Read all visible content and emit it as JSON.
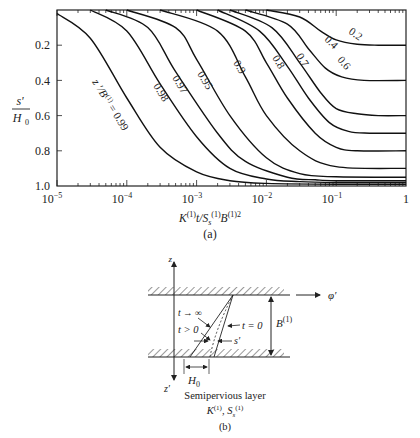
{
  "chart_data": [
    {
      "panel": "(a)",
      "type": "line",
      "title": "",
      "xlabel": "K(1) t / Ss(1) B(1)2",
      "ylabel": "s' / H0",
      "xscale": "log",
      "xlim": [
        1e-05,
        1
      ],
      "ylim": [
        1.0,
        0
      ],
      "y_inverted": true,
      "grid": false,
      "legend": "inline curve labels",
      "x_ticks": [
        "10^-5",
        "10^-4",
        "10^-3",
        "10^-2",
        "10^-1",
        "1"
      ],
      "y_ticks": [
        "0.2",
        "0.4",
        "0.6",
        "0.8",
        "1.0"
      ],
      "curve_parameter": "z'/B(1)",
      "series": [
        {
          "name": "0.99",
          "label": "z'/B(1) = 0.99",
          "x": [
            1e-05,
            3e-05,
            0.0001,
            0.0003,
            0.001,
            0.003,
            0.01,
            0.1,
            1
          ],
          "values": [
            0.02,
            0.16,
            0.5,
            0.78,
            0.92,
            0.97,
            0.985,
            0.99,
            0.99
          ]
        },
        {
          "name": "0.98",
          "label": "0.98",
          "x": [
            3e-05,
            0.0001,
            0.0003,
            0.001,
            0.003,
            0.01,
            0.03,
            0.1,
            1
          ],
          "values": [
            0.0,
            0.12,
            0.42,
            0.72,
            0.9,
            0.96,
            0.975,
            0.98,
            0.98
          ]
        },
        {
          "name": "0.97",
          "label": "0.97",
          "x": [
            5e-05,
            0.0002,
            0.0005,
            0.002,
            0.005,
            0.02,
            0.05,
            0.1,
            1
          ],
          "values": [
            0.0,
            0.1,
            0.35,
            0.7,
            0.86,
            0.95,
            0.965,
            0.97,
            0.97
          ]
        },
        {
          "name": "0.95",
          "label": "0.95",
          "x": [
            0.0001,
            0.0005,
            0.001,
            0.003,
            0.01,
            0.03,
            0.1,
            1
          ],
          "values": [
            0.0,
            0.1,
            0.28,
            0.6,
            0.84,
            0.93,
            0.948,
            0.95
          ]
        },
        {
          "name": "0.9",
          "label": "0.9",
          "x": [
            0.0003,
            0.002,
            0.005,
            0.01,
            0.03,
            0.1,
            1
          ],
          "values": [
            0.0,
            0.12,
            0.38,
            0.6,
            0.8,
            0.89,
            0.9
          ]
        },
        {
          "name": "0.8",
          "label": "0.8",
          "x": [
            0.001,
            0.005,
            0.01,
            0.02,
            0.05,
            0.1,
            0.2,
            1
          ],
          "values": [
            0.0,
            0.12,
            0.3,
            0.5,
            0.7,
            0.78,
            0.8,
            0.8
          ]
        },
        {
          "name": "0.7",
          "label": "0.7",
          "x": [
            0.002,
            0.008,
            0.02,
            0.04,
            0.08,
            0.15,
            0.3,
            1
          ],
          "values": [
            0.0,
            0.12,
            0.32,
            0.5,
            0.64,
            0.69,
            0.7,
            0.7
          ]
        },
        {
          "name": "0.6",
          "label": "0.6",
          "x": [
            0.003,
            0.012,
            0.03,
            0.06,
            0.1,
            0.2,
            0.4,
            1
          ],
          "values": [
            0.0,
            0.1,
            0.3,
            0.47,
            0.56,
            0.59,
            0.6,
            0.6
          ]
        },
        {
          "name": "0.4",
          "label": "0.4",
          "x": [
            0.005,
            0.02,
            0.04,
            0.07,
            0.12,
            0.25,
            1
          ],
          "values": [
            0.0,
            0.08,
            0.22,
            0.33,
            0.38,
            0.4,
            0.4
          ]
        },
        {
          "name": "0.2",
          "label": "0.2",
          "x": [
            0.01,
            0.03,
            0.06,
            0.1,
            0.2,
            0.4,
            1
          ],
          "values": [
            0.0,
            0.04,
            0.12,
            0.17,
            0.195,
            0.2,
            0.2
          ]
        }
      ],
      "caption": "(a)"
    },
    {
      "panel": "(b)",
      "type": "diagram",
      "labels": {
        "z_axis": "z",
        "z_prime_axis": "z'",
        "phi_axis": "φ'",
        "thickness": "B(1)",
        "t_inf": "t → ∞",
        "t_pos": "t > 0",
        "t_zero": "t = 0",
        "drawdown": "s'",
        "head": "H0",
        "layer_name": "Semipervious layer",
        "layer_props": "K(1), Ss(1)"
      },
      "caption": "(b)"
    }
  ],
  "axes": {
    "y_label_num": "s'",
    "y_label_den": "H",
    "y_label_den_sub": "0",
    "x_label_parts": {
      "K": "K",
      "sup1": "(1)",
      "mid": "t/S",
      "sub": "s",
      "sup2": "(1)",
      "B": "B",
      "sup3": "(1)2"
    },
    "x_tick_labels": [
      {
        "base": "10",
        "exp": "−5"
      },
      {
        "base": "10",
        "exp": "−4"
      },
      {
        "base": "10",
        "exp": "−3"
      },
      {
        "base": "10",
        "exp": "−2"
      },
      {
        "base": "10",
        "exp": "−1"
      },
      {
        "base": "1",
        "exp": ""
      }
    ],
    "y_tick_labels": [
      "0.2",
      "0.4",
      "0.6",
      "0.8",
      "1.0"
    ],
    "curve_param_prefix": "z ′/B",
    "curve_param_sup": "(1)",
    "curve_param_suffix": " = 0.99"
  },
  "captions": {
    "a": "(a)",
    "b": "(b)"
  },
  "diagram": {
    "z": "z",
    "z_prime": "z",
    "z_prime_mark": "′",
    "phi": "φ′",
    "B": "B",
    "B_sup": "(1)",
    "t_inf": "t → ∞",
    "t_pos": "t > 0",
    "t_zero": "t = 0",
    "s_prime": "s′",
    "H": "H",
    "H_sub": "0",
    "layer_name": "Semipervious layer",
    "K": "K",
    "K_sup": "(1)",
    "S": ", S",
    "S_sub": "s",
    "S_sup": "(1)"
  }
}
